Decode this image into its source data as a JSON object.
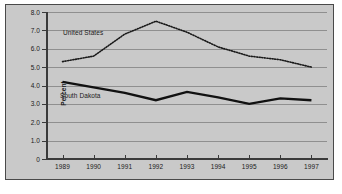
{
  "chart_data": {
    "type": "line",
    "title": "",
    "xlabel": "",
    "ylabel": "Percent",
    "categories": [
      "1989",
      "1990",
      "1991",
      "1992",
      "1993",
      "1994",
      "1995",
      "1996",
      "1997"
    ],
    "x": [
      1989,
      1990,
      1991,
      1992,
      1993,
      1994,
      1995,
      1996,
      1997
    ],
    "ylim": [
      0,
      8.0
    ],
    "yticks": [
      0,
      1.0,
      2.0,
      3.0,
      4.0,
      5.0,
      6.0,
      7.0,
      8.0
    ],
    "ytick_labels": [
      "0",
      "1.0",
      "2.0",
      "3.0",
      "4.0",
      "5.0",
      "6.0",
      "7.0",
      "8.0"
    ],
    "grid": true,
    "legend": "inline-labels",
    "series": [
      {
        "name": "United States",
        "style": "dotted",
        "color": "#1a1a1a",
        "values": [
          5.3,
          5.6,
          6.8,
          7.5,
          6.9,
          6.1,
          5.6,
          5.4,
          5.0
        ]
      },
      {
        "name": "South Dakota",
        "style": "solid-thick",
        "color": "#111111",
        "values": [
          4.2,
          3.9,
          3.6,
          3.2,
          3.65,
          3.35,
          3.0,
          3.3,
          3.2
        ]
      }
    ]
  },
  "figure": {
    "panel_color": "#c9c9c9",
    "grid_color": "#8f8f8f",
    "axis_color": "#3a3a3a",
    "frame_color": "#4a4a4a",
    "background": "#ffffff"
  }
}
